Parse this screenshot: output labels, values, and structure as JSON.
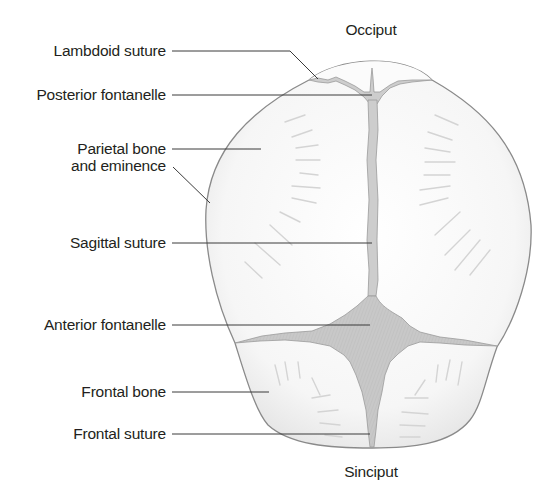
{
  "figure": {
    "title_top": "Occiput",
    "title_bottom": "Sinciput"
  },
  "labels": [
    {
      "id": "lambdoid-suture",
      "text": "Lambdoid suture"
    },
    {
      "id": "posterior-fontanelle",
      "text": "Posterior fontanelle"
    },
    {
      "id": "parietal-bone",
      "line1": "Parietal bone",
      "line2": "and eminence"
    },
    {
      "id": "sagittal-suture",
      "text": "Sagittal suture"
    },
    {
      "id": "anterior-fontanelle",
      "text": "Anterior fontanelle"
    },
    {
      "id": "frontal-bone",
      "text": "Frontal bone"
    },
    {
      "id": "frontal-suture",
      "text": "Frontal suture"
    }
  ],
  "colors": {
    "outline": "#8a8a8a",
    "fontanelle_fill": "#c9c9c9",
    "bone_fill": "#f7f7f7",
    "leader_line": "#3a3a3a",
    "text": "#231f20"
  }
}
